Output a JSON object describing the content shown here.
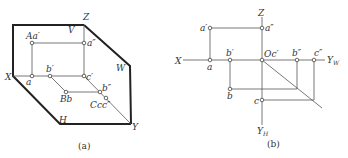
{
  "figure_a": {
    "caption": "(a)",
    "planes": {
      "V": "V",
      "W": "W",
      "H": "H"
    },
    "axes": {
      "X": "X",
      "Y": "Y",
      "Z": "Z"
    },
    "points": {
      "A": "Aa′",
      "a_double": "a″",
      "a": "a",
      "b_prime": "b′",
      "c_prime": "c′",
      "B": "Bb",
      "b_double": "b″",
      "C": "Ccc″"
    }
  },
  "figure_b": {
    "caption": "(b)",
    "axes": {
      "X": "X",
      "Z": "Z",
      "YW": "Y",
      "YW_sub": "W",
      "YH": "Y",
      "YH_sub": "H"
    },
    "points": {
      "a_prime": "a′",
      "a_double": "a″",
      "a": "a",
      "b_prime": "b′",
      "origin": "Oc′",
      "b_double": "b″",
      "c_double": "c″",
      "b": "b",
      "c": "c"
    }
  }
}
